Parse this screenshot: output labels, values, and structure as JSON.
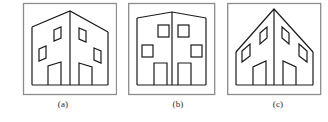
{
  "figure": {
    "kind": "line-drawing-figure",
    "background_color": "#ffffff",
    "panel_border_color": "#8c8c8c",
    "drawing_stroke_color": "#1a1a1a",
    "caption_color": "#2b2b2b",
    "panel_count": 3
  },
  "panels": [
    {
      "id": "panel-a",
      "caption": "(a)",
      "subject": "house-line-drawing",
      "view": "oblique-perspective",
      "frame": {
        "x": 16,
        "y": 3,
        "width": 94,
        "height": 92
      },
      "description": "Two-faced house with central vertical ridge, roof sloping down to left and right, skewed parallelogram windows",
      "windows": 4,
      "doors": 2,
      "roof_peak_height": 16
    },
    {
      "id": "panel-b",
      "caption": "(b)",
      "subject": "house-line-drawing",
      "view": "flattened-frontal",
      "frame": {
        "x": 121,
        "y": 3,
        "width": 86,
        "height": 92
      },
      "description": "Flattened house with nearly level roofline and slight central peak, axis-aligned square windows",
      "windows": 4,
      "doors": 2,
      "roof_peak_height": 6
    },
    {
      "id": "panel-c",
      "caption": "(c)",
      "subject": "house-line-drawing",
      "view": "steep-perspective",
      "frame": {
        "x": 218,
        "y": 3,
        "width": 93,
        "height": 92
      },
      "description": "House with tall central peak and steeply sloping roof edges, diamond-skewed windows",
      "windows": 4,
      "doors": 2,
      "roof_peak_height": 30
    }
  ],
  "captions": {
    "a": "(a)",
    "b": "(b)",
    "c": "(c)"
  }
}
